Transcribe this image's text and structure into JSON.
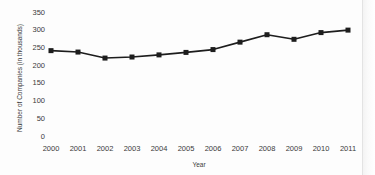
{
  "chart_data": {
    "type": "line",
    "title": "",
    "xlabel": "Year",
    "ylabel": "Number of Companies (in thousands)",
    "categories": [
      "2000",
      "2001",
      "2002",
      "2003",
      "2004",
      "2005",
      "2006",
      "2007",
      "2008",
      "2009",
      "2010",
      "2011"
    ],
    "values": [
      240,
      236,
      219,
      222,
      228,
      235,
      243,
      264,
      285,
      272,
      291,
      298
    ],
    "series": [
      {
        "name": "Number of Companies",
        "values": [
          240,
          236,
          219,
          222,
          228,
          235,
          243,
          264,
          285,
          272,
          291,
          298
        ]
      }
    ],
    "ylim": [
      0,
      350
    ],
    "yticks": [
      0,
      50,
      100,
      150,
      200,
      250,
      300,
      350
    ],
    "ytick_labels": [
      "0",
      "50",
      "100",
      "150",
      "200",
      "250",
      "300",
      "350"
    ],
    "xtick_labels": [
      "2000",
      "2001",
      "2002",
      "2003",
      "2004",
      "2005",
      "2006",
      "2007",
      "2008",
      "2009",
      "2010",
      "2011"
    ],
    "grid": false,
    "legend": false,
    "legend_position": "none",
    "marker": "square",
    "line_color": "#1d1d1d",
    "marker_color": "#1d1d1d",
    "background_color": "#ffffff"
  },
  "axes": {
    "y_title": "Number of Companies (in thousands)",
    "x_title": "Year"
  }
}
